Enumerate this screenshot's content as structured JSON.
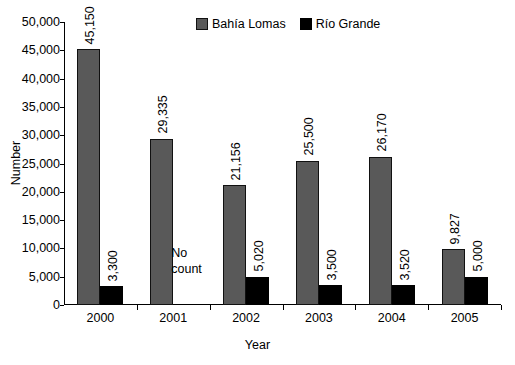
{
  "chart_data": {
    "type": "bar",
    "title": "",
    "subtitle": "",
    "xlabel": "Year",
    "ylabel": "Number",
    "categories": [
      "2000",
      "2001",
      "2002",
      "2003",
      "2004",
      "2005"
    ],
    "series": [
      {
        "name": "Bahía  Lomas",
        "color": "#595959",
        "values": [
          45150,
          29335,
          21156,
          25500,
          26170,
          9827
        ],
        "value_labels": [
          "45,150",
          "29,335",
          "21,156",
          "25,500",
          "26,170",
          "9,827"
        ]
      },
      {
        "name": "Río Grande",
        "color": "#000000",
        "values": [
          3300,
          null,
          5020,
          3500,
          3520,
          5000
        ],
        "value_labels": [
          "3,300",
          null,
          "5,020",
          "3,500",
          "3,520",
          "5,000"
        ]
      }
    ],
    "ylim": [
      0,
      50000
    ],
    "ytick_values": [
      0,
      5000,
      10000,
      15000,
      20000,
      25000,
      30000,
      35000,
      40000,
      45000,
      50000
    ],
    "ytick_labels": [
      "0",
      "5,000",
      "10,000",
      "15,000",
      "20,000",
      "25,000",
      "30,000",
      "35,000",
      "40,000",
      "45,000",
      "50,000"
    ],
    "grid": false,
    "legend_position": "top-center",
    "annotations": [
      {
        "text": "No\ncount",
        "category": "2001",
        "series": "Río Grande",
        "note": "no data collected"
      }
    ]
  },
  "legend": {
    "entries": [
      {
        "label": "Bahía  Lomas",
        "swatch": "gray-swatch-icon"
      },
      {
        "label": "Río Grande",
        "swatch": "black-swatch-icon"
      }
    ]
  },
  "axes": {
    "y_title": "Number",
    "x_title": "Year"
  }
}
